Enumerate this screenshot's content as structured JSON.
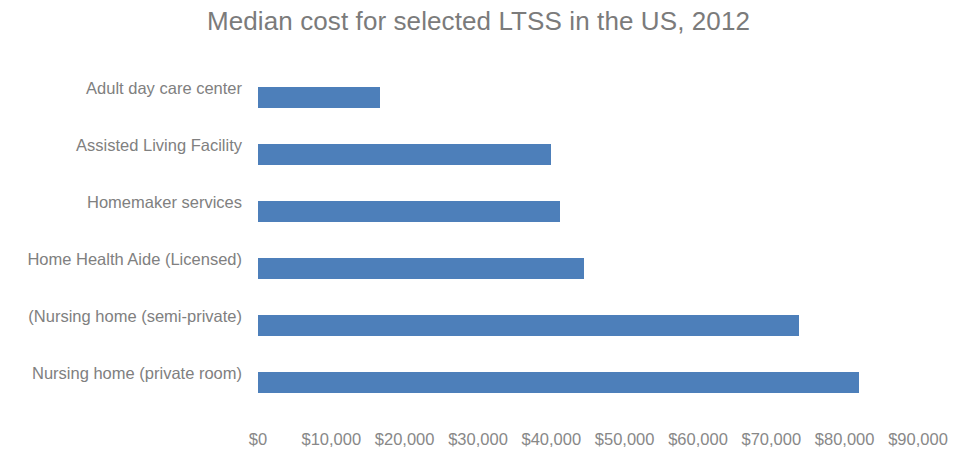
{
  "chart_data": {
    "type": "bar",
    "orientation": "horizontal",
    "title": "Median cost for selected LTSS in the US, 2012",
    "xlabel": "",
    "ylabel": "",
    "categories": [
      "Adult day care center",
      "Assisted Living Facility",
      "Homemaker services",
      "Home Health Aide (Licensed)",
      "(Nursing home (semi-private)",
      "Nursing home (private room)"
    ],
    "values": [
      16600,
      40000,
      41200,
      44400,
      73800,
      81900
    ],
    "value_labels": [
      "$16,600",
      "$40,000",
      "$41,200",
      "$44,400",
      "$73,800",
      "$81,900"
    ],
    "xlim": [
      0,
      90000
    ],
    "xticks": [
      0,
      10000,
      20000,
      30000,
      40000,
      50000,
      60000,
      70000,
      80000,
      90000
    ],
    "xtick_labels": [
      "$0",
      "$10,000",
      "$20,000",
      "$30,000",
      "$40,000",
      "$50,000",
      "$60,000",
      "$70,000",
      "$80,000",
      "$90,000"
    ],
    "grid": false,
    "legend": null,
    "series": [
      {
        "name": "Median cost",
        "color": "#4d7fba",
        "values": [
          16600,
          40000,
          41200,
          44400,
          73800,
          81900
        ]
      }
    ]
  },
  "colors": {
    "bar": "#4d7fba",
    "title_text": "#7b7b7b",
    "axis_text": "#888888",
    "category_text": "#808080",
    "background": "#ffffff"
  }
}
